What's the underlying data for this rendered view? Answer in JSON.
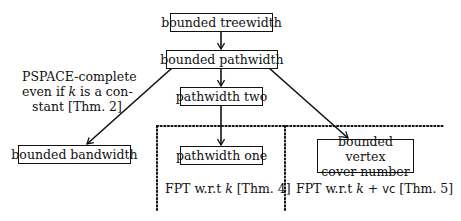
{
  "diagram": {
    "nodes": {
      "treewidth": "bounded treewidth",
      "pathwidth": "bounded pathwidth",
      "pathwidth_two": "pathwidth two",
      "pathwidth_one": "pathwidth one",
      "bandwidth": "bounded bandwidth",
      "vertex_cover_line1": "bounded vertex",
      "vertex_cover_line2": "cover number"
    },
    "annotations": {
      "pspace_line1": "PSPACE-complete",
      "pspace_line2_pre": "even if ",
      "pspace_line2_var": "k",
      "pspace_line2_post": " is a con-",
      "pspace_line3": "stant [Thm. 2]",
      "fpt_k_pre": "FPT w.r.t ",
      "fpt_k_var": "k",
      "fpt_k_post": " [Thm. 4]",
      "fpt_kvc_pre": "FPT w.r.t ",
      "fpt_kvc_var": "k",
      "fpt_kvc_plus": " + ",
      "fpt_kvc_vc": "vc",
      "fpt_kvc_post": " [Thm. 5]"
    },
    "edges": [
      {
        "from": "treewidth",
        "to": "pathwidth"
      },
      {
        "from": "pathwidth",
        "to": "pathwidth_two"
      },
      {
        "from": "pathwidth",
        "to": "bandwidth"
      },
      {
        "from": "pathwidth",
        "to": "vertex_cover"
      },
      {
        "from": "pathwidth_two",
        "to": "pathwidth_one"
      }
    ],
    "regions": [
      {
        "name": "fpt-k-region",
        "style": "dotted"
      },
      {
        "name": "fpt-k-vc-region",
        "style": "dotted"
      }
    ],
    "colors": {
      "stroke": "#111111",
      "background": "#ffffff"
    }
  }
}
